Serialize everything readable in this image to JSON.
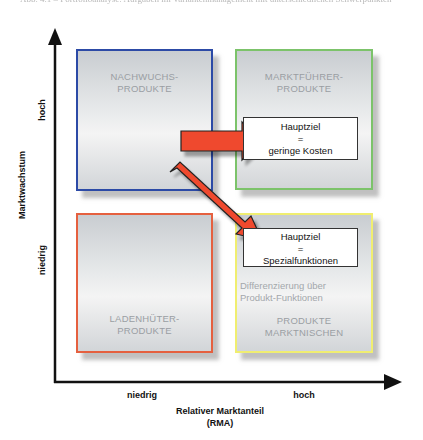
{
  "caption": "Abb. 4.1 – Portfolioanalyse: Aufgaben im Variantenmanagement mit unterschiedlichen Schwerpunkten",
  "y_axis": {
    "title": "Marktwachstum",
    "high_label": "hoch",
    "low_label": "niedrig"
  },
  "x_axis": {
    "title_line1": "Relativer Marktanteil",
    "title_line2": "(RMA)",
    "low_label": "niedrig",
    "high_label": "hoch"
  },
  "quadrants": {
    "top_left": {
      "line1": "NACHWUCHS-",
      "line2": "PRODUKTE",
      "border_color": "#2c4aa6"
    },
    "top_right": {
      "line1": "MARKTFÜHRER-",
      "line2": "PRODUKTE",
      "border_color": "#7cc36a"
    },
    "bottom_left": {
      "line1": "LADENHÜTER-",
      "line2": "PRODUKTE",
      "border_color": "#e5603f"
    },
    "bottom_right": {
      "line1": "PRODUKTE",
      "line2": "MARKTNISCHEN",
      "border_color": "#f0ee70"
    }
  },
  "goals": {
    "top_right": {
      "line1": "Hauptziel",
      "line2": "=",
      "line3": "geringe Kosten"
    },
    "bottom_right": {
      "line1": "Hauptziel",
      "line2": "=",
      "line3": "Spezialfunktionen"
    }
  },
  "differentiation": {
    "line1": "Differenzierung über",
    "line2": "Produkt-Funktionen"
  },
  "arrow_color": "#ef4a2e"
}
